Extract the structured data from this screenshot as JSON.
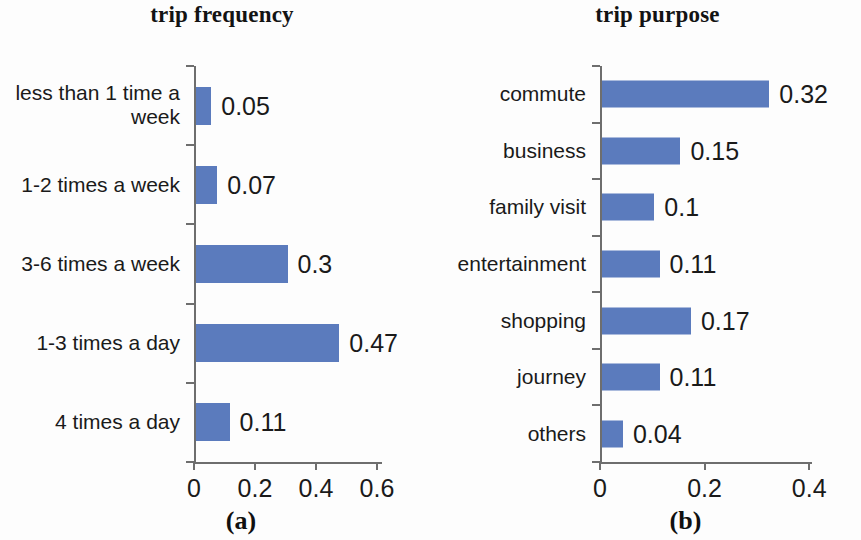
{
  "figure": {
    "panels": [
      {
        "caption": "(a)",
        "title": "trip frequency",
        "chart_data": {
          "type": "bar",
          "orientation": "horizontal",
          "title": "trip frequency",
          "xlabel": "",
          "ylabel": "",
          "xlim": [
            0,
            0.6
          ],
          "xticks": [
            "0",
            "0.2",
            "0.4",
            "0.6"
          ],
          "xtick_values": [
            0,
            0.2,
            0.4,
            0.6
          ],
          "grid": false,
          "legend": false,
          "bar_color": "#5b7bbd",
          "categories": [
            "less than 1 time a\nweek",
            "1-2 times a week",
            "3-6 times a week",
            "1-3 times a day",
            "4 times a day"
          ],
          "values": [
            0.05,
            0.07,
            0.3,
            0.47,
            0.11
          ],
          "value_labels": [
            "0.05",
            "0.07",
            "0.3",
            "0.47",
            "0.11"
          ]
        }
      },
      {
        "caption": "(b)",
        "title": "trip purpose",
        "chart_data": {
          "type": "bar",
          "orientation": "horizontal",
          "title": "trip purpose",
          "xlabel": "",
          "ylabel": "",
          "xlim": [
            0,
            0.4
          ],
          "xticks": [
            "0",
            "0.2",
            "0.4"
          ],
          "xtick_values": [
            0,
            0.2,
            0.4
          ],
          "grid": false,
          "legend": false,
          "bar_color": "#5b7bbd",
          "categories": [
            "commute",
            "business",
            "family visit",
            "entertainment",
            "shopping",
            "journey",
            "others"
          ],
          "values": [
            0.32,
            0.15,
            0.1,
            0.11,
            0.17,
            0.11,
            0.04
          ],
          "value_labels": [
            "0.32",
            "0.15",
            "0.1",
            "0.11",
            "0.17",
            "0.11",
            "0.04"
          ]
        }
      }
    ]
  }
}
